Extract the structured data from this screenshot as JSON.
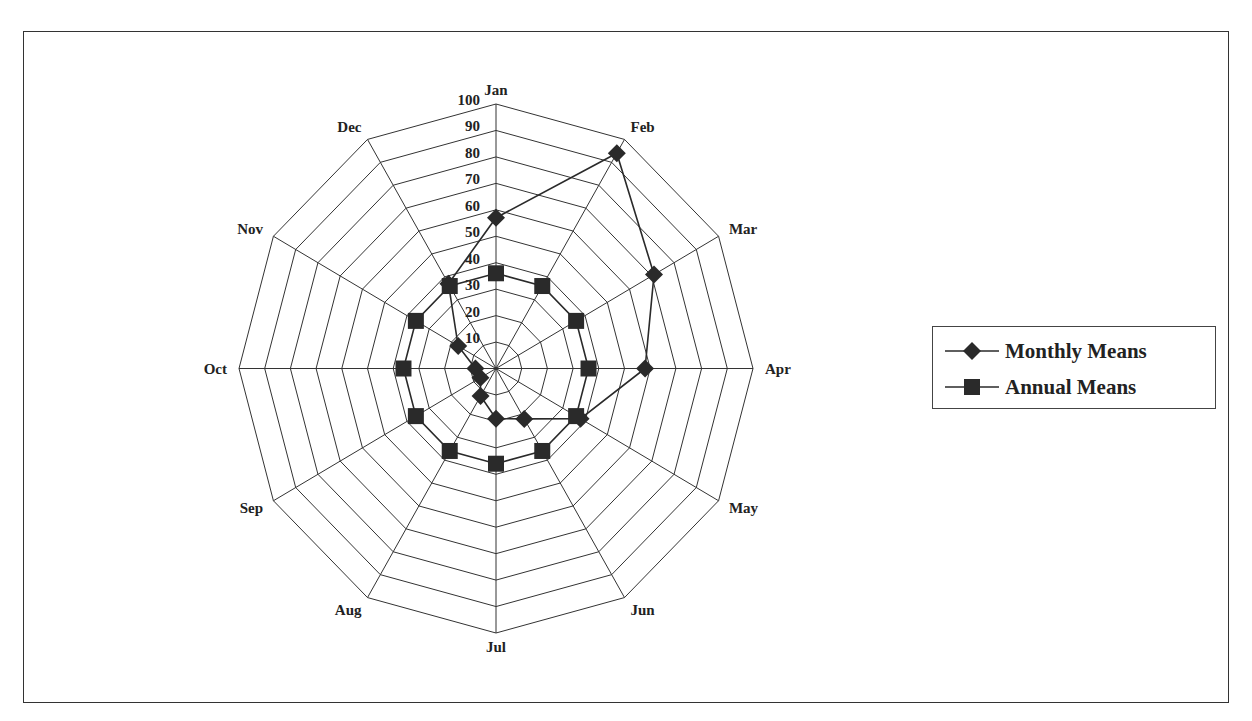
{
  "chart_data": {
    "type": "radar",
    "title": "",
    "categories": [
      "Jan",
      "Feb",
      "Mar",
      "Apr",
      "May",
      "Jun",
      "Jul",
      "Aug",
      "Sep",
      "Oct",
      "Nov",
      "Dec"
    ],
    "series": [
      {
        "name": "Monthly Means",
        "marker": "diamond",
        "values": [
          57,
          94,
          71,
          58,
          38,
          22,
          19,
          12,
          7,
          8,
          17,
          37
        ]
      },
      {
        "name": "Annual Means",
        "marker": "square",
        "values": [
          36,
          36,
          36,
          36,
          36,
          36,
          36,
          36,
          36,
          36,
          36,
          36
        ]
      }
    ],
    "radial_axis": {
      "min": 0,
      "max": 100,
      "step": 10,
      "tick_labels": [
        "10",
        "20",
        "30",
        "40",
        "50",
        "60",
        "70",
        "80",
        "90",
        "100"
      ]
    },
    "grid": true,
    "legend_position": "right",
    "colors": {
      "line": "#2a2a2a",
      "marker": "#2a2a2a",
      "grid": "#333333",
      "background": "#ffffff"
    }
  },
  "legend": {
    "items": [
      {
        "label": "Monthly Means",
        "marker": "diamond"
      },
      {
        "label": "Annual Means",
        "marker": "square"
      }
    ]
  }
}
